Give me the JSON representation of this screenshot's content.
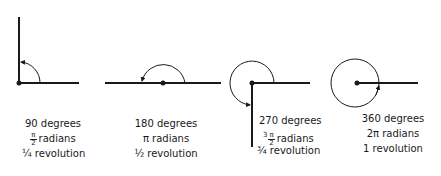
{
  "colors": {
    "stroke": "#1a1a1a",
    "background": "#ffffff"
  },
  "figures": [
    {
      "degrees": "90 degrees",
      "radians_num": "π",
      "radians_den": "2",
      "radians_word": "radians",
      "revolution": "¼ revolution"
    },
    {
      "degrees": "180 degrees",
      "radians": "π radians",
      "revolution": "½ revolution"
    },
    {
      "degrees": "270 degrees",
      "radians_coef": "3",
      "radians_num": "π",
      "radians_den": "2",
      "radians_word": "radians",
      "revolution": "¾ revolution"
    },
    {
      "degrees": "360 degrees",
      "radians": "2π radians",
      "revolution": "1 revolution"
    }
  ]
}
